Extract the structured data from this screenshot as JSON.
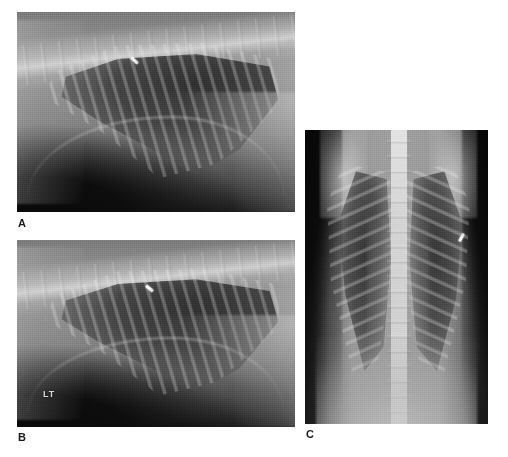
{
  "figure": {
    "type": "multi-panel-radiograph-figure",
    "modality": "radiography",
    "anatomy": "thorax",
    "background_color": "#ffffff",
    "panel_count": 3
  },
  "panels": [
    {
      "id": "A",
      "label": "A",
      "view": "lateral thoracic radiograph",
      "position": {
        "x": 17,
        "y": 12,
        "width": 278,
        "height": 200
      },
      "annotations": [
        {
          "name": "arrow-marker",
          "label": "",
          "x": 113,
          "y": 47
        }
      ]
    },
    {
      "id": "B",
      "label": "B",
      "view": "lateral thoracic radiograph",
      "position": {
        "x": 17,
        "y": 240,
        "width": 278,
        "height": 187
      },
      "annotations": [
        {
          "name": "arrow-marker",
          "label": "",
          "x": 128,
          "y": 47
        },
        {
          "name": "position-marker",
          "label": "LT",
          "x": 26,
          "y": 150
        }
      ]
    },
    {
      "id": "C",
      "label": "C",
      "view": "dorsoventral thoracic radiograph",
      "position": {
        "x": 305,
        "y": 130,
        "width": 183,
        "height": 294
      },
      "annotations": [
        {
          "name": "arrow-marker",
          "label": "",
          "x": 152,
          "y": 106
        }
      ]
    }
  ],
  "markers": {
    "lt": "LT"
  },
  "labels": {
    "panel_a": "A",
    "panel_b": "B",
    "panel_c": "C"
  },
  "colors": {
    "page_background": "#ffffff",
    "label_text": "#1a1a1a",
    "marker_text": "#d9d9d9",
    "film_midtone": "#8a8a8a",
    "film_dark": "#0a0a0a",
    "film_bright": "#e8e8e8"
  }
}
